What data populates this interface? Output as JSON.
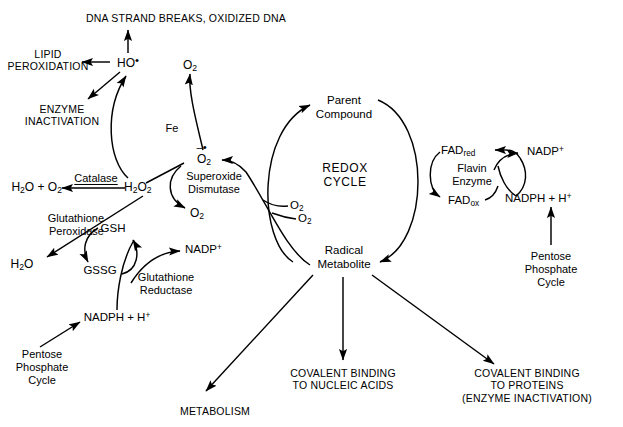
{
  "diagram": {
    "title_top": "DNA STRAND BREAKS,  OXIDIZED DNA",
    "center_label_line1": "REDOX",
    "center_label_line2": "CYCLE",
    "nodes": {
      "lipid_peroxidation_l1": "LIPID",
      "lipid_peroxidation_l2": "PEROXIDATION",
      "enzyme_inactivation_l1": "ENZYME",
      "enzyme_inactivation_l2": "INACTIVATION",
      "hydroxyl_radical": "HO",
      "hydroxyl_radical_dot": "•",
      "oxygen_top": "O",
      "oxygen_top_sub": "2",
      "iron": "Fe",
      "water_plus_oxygen": "H",
      "catalase": "Catalase",
      "hydrogen_peroxide": "H",
      "superoxide_name_l1": "Superoxide",
      "superoxide_name_l2": "Dismutase",
      "superoxide_species": "O",
      "oxygen_sod": "O",
      "glutathione_peroxidase_l1": "Glutathione",
      "glutathione_peroxidase_l2": "Peroxidase",
      "water": "H",
      "gsh": "GSH",
      "gssg": "GSSG",
      "glutathione_reductase_l1": "Glutathione",
      "glutathione_reductase_l2": "Reductase",
      "nadp_plus_left": "NADP",
      "nadph_h_left": "NADPH + H",
      "pentose_left_l1": "Pentose",
      "pentose_left_l2": "Phosphate",
      "pentose_left_l3": "Cycle",
      "parent_compound_l1": "Parent",
      "parent_compound_l2": "Compound",
      "radical_metabolite_l1": "Radical",
      "radical_metabolite_l2": "Metabolite",
      "oxygen_cycle": "O",
      "oxygen_radical_branch": "O",
      "fad_red": "FAD",
      "fad_red_sub": "red",
      "fad_ox": "FAD",
      "fad_ox_sub": "ox",
      "flavin_enzyme_l1": "Flavin",
      "flavin_enzyme_l2": "Enzyme",
      "nadp_plus_right": "NADP",
      "nadph_h_right": "NADPH + H",
      "pentose_right_l1": "Pentose",
      "pentose_right_l2": "Phosphate",
      "pentose_right_l3": "Cycle",
      "metabolism": "METABOLISM",
      "covalent_nucleic_l1": "COVALENT BINDING",
      "covalent_nucleic_l2": "TO NUCLEIC ACIDS",
      "covalent_protein_l1": "COVALENT BINDING",
      "covalent_protein_l2": "TO PROTEINS",
      "covalent_protein_l3": "(ENZYME INACTIVATION)"
    },
    "colors": {
      "ink": "#000000",
      "background": "#ffffff"
    }
  }
}
